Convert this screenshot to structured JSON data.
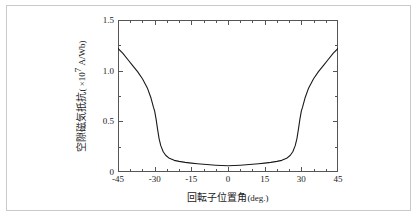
{
  "figure": {
    "background_color": "#ffffff",
    "border_color": "#c9c9c9",
    "axis_color": "#555555",
    "curve_color": "#1a1a1a"
  },
  "axis_titles": {
    "x_text": "回転子位置角",
    "x_unit": "(deg.)",
    "y_text": "空隙磁気抵抗",
    "y_unit_open": "( ×10",
    "y_unit_exp": "7",
    "y_unit_close": " A/Wb)"
  },
  "x_ticks": [
    {
      "value": -45,
      "label": "-45"
    },
    {
      "value": -30,
      "label": "-30"
    },
    {
      "value": -15,
      "label": "-15"
    },
    {
      "value": 0,
      "label": "0"
    },
    {
      "value": 15,
      "label": "15"
    },
    {
      "value": 30,
      "label": "30"
    },
    {
      "value": 45,
      "label": "45"
    }
  ],
  "y_ticks": [
    {
      "value": 0,
      "label": "0"
    },
    {
      "value": 0.5,
      "label": "0.5"
    },
    {
      "value": 1.0,
      "label": "1.0"
    },
    {
      "value": 1.5,
      "label": "1.5"
    }
  ],
  "chart_data": {
    "type": "line",
    "title": "",
    "subtitle": "",
    "xlabel": "回転子位置角 (deg.)",
    "ylabel": "空隙磁気抵抗 ( ×10^7 A/Wb)",
    "xlim": [
      -45,
      45
    ],
    "ylim": [
      0,
      1.5
    ],
    "x_major_tick_step": 15,
    "x_minor_tick_step": 5,
    "y_major_tick_step": 0.5,
    "y_minor_tick_step": 0.25,
    "grid": false,
    "legend": null,
    "legend_position": "none",
    "annotations": [],
    "series": [
      {
        "name": "空隙磁気抵抗",
        "color": "#1a1a1a",
        "line_width": 1.1,
        "x": [
          -45,
          -43,
          -41,
          -39,
          -37,
          -35,
          -33,
          -31.5,
          -30.5,
          -30,
          -29.4,
          -28.8,
          -28.2,
          -27.5,
          -26.5,
          -25.5,
          -24,
          -22,
          -20,
          -17.5,
          -15,
          -12.5,
          -10,
          -7.5,
          -5,
          -2.5,
          0,
          2.5,
          5,
          7.5,
          10,
          12.5,
          15,
          17.5,
          20,
          22,
          24,
          25.5,
          26.5,
          27.5,
          28.2,
          28.8,
          29.4,
          30,
          30.5,
          31.5,
          33,
          35,
          37,
          39,
          41,
          43,
          45
        ],
        "y": [
          1.22,
          1.17,
          1.11,
          1.05,
          0.99,
          0.92,
          0.83,
          0.73,
          0.64,
          0.6,
          0.52,
          0.42,
          0.33,
          0.26,
          0.2,
          0.165,
          0.135,
          0.115,
          0.105,
          0.095,
          0.088,
          0.082,
          0.076,
          0.071,
          0.067,
          0.064,
          0.062,
          0.064,
          0.067,
          0.071,
          0.076,
          0.082,
          0.088,
          0.095,
          0.105,
          0.115,
          0.135,
          0.165,
          0.2,
          0.26,
          0.33,
          0.42,
          0.52,
          0.6,
          0.64,
          0.73,
          0.83,
          0.92,
          0.99,
          1.05,
          1.11,
          1.17,
          1.22
        ]
      }
    ]
  }
}
